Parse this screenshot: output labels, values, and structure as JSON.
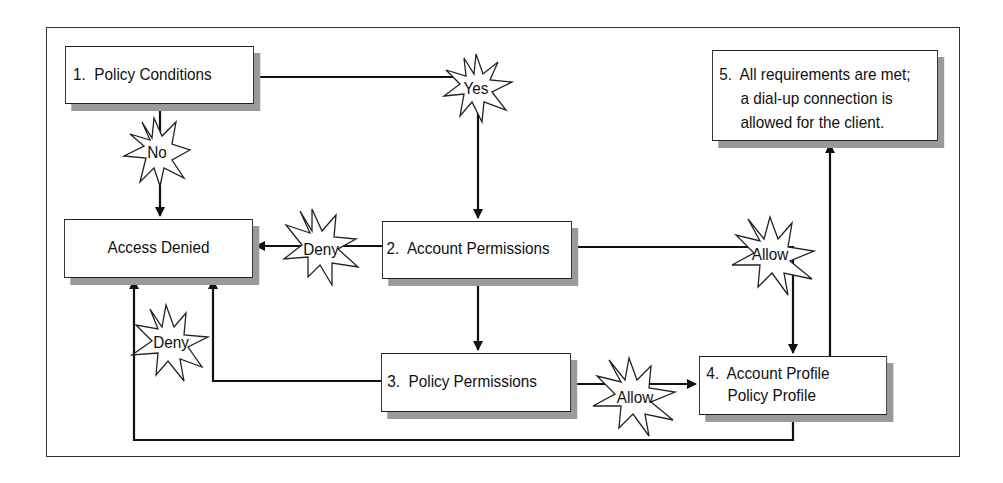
{
  "diagram": {
    "nodes": [
      {
        "id": "1",
        "label": "1.  Policy Conditions"
      },
      {
        "id": "denied",
        "label": "Access Denied"
      },
      {
        "id": "2",
        "label": "2.  Account Permissions"
      },
      {
        "id": "3",
        "label": "3.  Policy Permissions"
      },
      {
        "id": "4",
        "line1": "4.  Account Profile",
        "line2": "     Policy Profile"
      },
      {
        "id": "5",
        "line1": "5.  All requirements are met;",
        "line2": "     a dial-up connection is",
        "line3": "     allowed for the client."
      }
    ],
    "labels": {
      "yes": "Yes",
      "no": "No",
      "deny_account": "Deny",
      "deny_policy": "Deny",
      "allow_account": "Allow",
      "allow_policy": "Allow"
    },
    "edges": [
      {
        "from": "1",
        "to": "2",
        "label": "Yes"
      },
      {
        "from": "1",
        "to": "denied",
        "label": "No"
      },
      {
        "from": "2",
        "to": "denied",
        "label": "Deny"
      },
      {
        "from": "2",
        "to": "3",
        "label": ""
      },
      {
        "from": "2",
        "to": "4",
        "label": "Allow"
      },
      {
        "from": "3",
        "to": "denied",
        "label": "Deny"
      },
      {
        "from": "3",
        "to": "4",
        "label": "Allow"
      },
      {
        "from": "4",
        "to": "denied",
        "label": ""
      },
      {
        "from": "4",
        "to": "5",
        "label": ""
      }
    ]
  }
}
